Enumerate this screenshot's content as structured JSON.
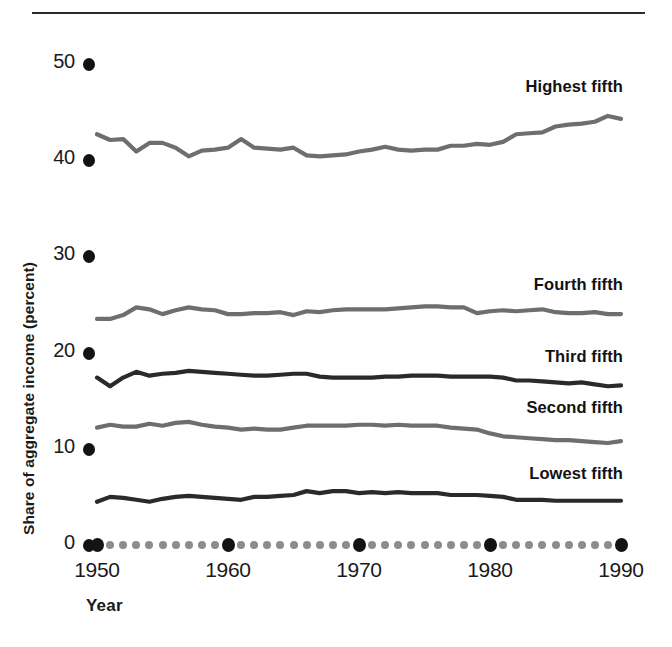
{
  "figure": {
    "top_rule": true,
    "background": "#ffffff"
  },
  "axes": {
    "y_title": "Share of aggregate income (percent)",
    "x_title": "Year",
    "y_ticks": [
      "0",
      "10",
      "20",
      "30",
      "40",
      "50"
    ],
    "x_ticks": [
      "1950",
      "1960",
      "1970",
      "1980",
      "1990"
    ]
  },
  "colors": {
    "ink": "#1a1a1a",
    "major_dot": "#131313",
    "minor_dot": "#8c8c8c",
    "light_line": "#6e6e6e",
    "dark_line": "#2a2a2a"
  },
  "chart_data": {
    "type": "line",
    "title": "",
    "xlabel": "Year",
    "ylabel": "Share of aggregate income (percent)",
    "xlim": [
      1950,
      1990
    ],
    "ylim": [
      0,
      52
    ],
    "grid": false,
    "legend": "inline-right-labels",
    "x": [
      1950,
      1951,
      1952,
      1953,
      1954,
      1955,
      1956,
      1957,
      1958,
      1959,
      1960,
      1961,
      1962,
      1963,
      1964,
      1965,
      1966,
      1967,
      1968,
      1969,
      1970,
      1971,
      1972,
      1973,
      1974,
      1975,
      1976,
      1977,
      1978,
      1979,
      1980,
      1981,
      1982,
      1983,
      1984,
      1985,
      1986,
      1987,
      1988,
      1989,
      1990
    ],
    "series": [
      {
        "name": "Highest fifth",
        "color": "#6e6e6e",
        "label_x": 1983.5,
        "label_y": 47.6,
        "values": [
          42.7,
          42.1,
          42.2,
          40.9,
          41.8,
          41.8,
          41.3,
          40.4,
          41.0,
          41.1,
          41.3,
          42.2,
          41.3,
          41.2,
          41.1,
          41.3,
          40.5,
          40.4,
          40.5,
          40.6,
          40.9,
          41.1,
          41.4,
          41.1,
          41.0,
          41.1,
          41.1,
          41.5,
          41.5,
          41.7,
          41.6,
          41.9,
          42.7,
          42.8,
          42.9,
          43.5,
          43.7,
          43.8,
          44.0,
          44.6,
          44.3
        ]
      },
      {
        "name": "Fourth fifth",
        "color": "#6e6e6e",
        "label_x": 1983.0,
        "label_y": 27.0,
        "values": [
          23.5,
          23.5,
          23.9,
          24.7,
          24.5,
          24.0,
          24.4,
          24.7,
          24.5,
          24.4,
          24.0,
          24.0,
          24.1,
          24.1,
          24.2,
          23.9,
          24.3,
          24.2,
          24.4,
          24.5,
          24.5,
          24.5,
          24.5,
          24.6,
          24.7,
          24.8,
          24.8,
          24.7,
          24.7,
          24.1,
          24.3,
          24.4,
          24.3,
          24.4,
          24.5,
          24.2,
          24.1,
          24.1,
          24.2,
          24.0,
          24.0
        ]
      },
      {
        "name": "Third fifth",
        "color": "#2a2a2a",
        "label_x": 1983.0,
        "label_y": 19.5,
        "values": [
          17.4,
          16.5,
          17.4,
          18.0,
          17.6,
          17.8,
          17.9,
          18.1,
          18.0,
          17.9,
          17.8,
          17.7,
          17.6,
          17.6,
          17.7,
          17.8,
          17.8,
          17.5,
          17.4,
          17.4,
          17.4,
          17.4,
          17.5,
          17.5,
          17.6,
          17.6,
          17.6,
          17.5,
          17.5,
          17.5,
          17.5,
          17.4,
          17.1,
          17.1,
          17.0,
          16.9,
          16.8,
          16.9,
          16.7,
          16.5,
          16.6
        ]
      },
      {
        "name": "Second fifth",
        "color": "#6e6e6e",
        "label_x": 1983.0,
        "label_y": 14.2,
        "values": [
          12.2,
          12.5,
          12.3,
          12.3,
          12.6,
          12.4,
          12.7,
          12.8,
          12.5,
          12.3,
          12.2,
          12.0,
          12.1,
          12.0,
          12.0,
          12.2,
          12.4,
          12.4,
          12.4,
          12.4,
          12.5,
          12.5,
          12.4,
          12.5,
          12.4,
          12.4,
          12.4,
          12.2,
          12.1,
          12.0,
          11.6,
          11.3,
          11.2,
          11.1,
          11.0,
          10.9,
          10.9,
          10.8,
          10.7,
          10.6,
          10.8
        ]
      },
      {
        "name": "Lowest fifth",
        "color": "#2a2a2a",
        "label_x": 1983.0,
        "label_y": 7.4,
        "values": [
          4.5,
          5.0,
          4.9,
          4.7,
          4.5,
          4.8,
          5.0,
          5.1,
          5.0,
          4.9,
          4.8,
          4.7,
          5.0,
          5.0,
          5.1,
          5.2,
          5.6,
          5.4,
          5.6,
          5.6,
          5.4,
          5.5,
          5.4,
          5.5,
          5.4,
          5.4,
          5.4,
          5.2,
          5.2,
          5.2,
          5.1,
          5.0,
          4.7,
          4.7,
          4.7,
          4.6,
          4.6,
          4.6,
          4.6,
          4.6,
          4.6
        ]
      }
    ]
  }
}
